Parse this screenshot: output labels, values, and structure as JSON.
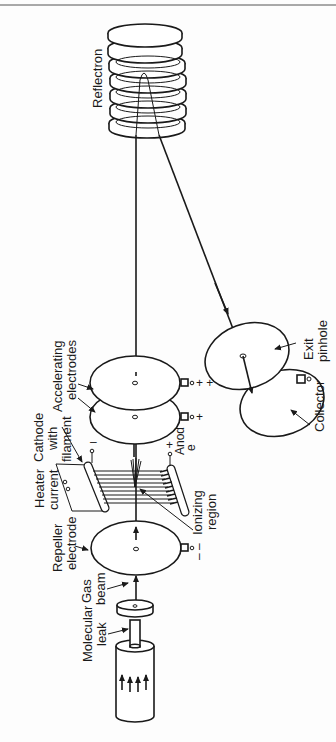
{
  "diagram": {
    "orientation": "rotated 90 degrees counter-clockwise",
    "labels": {
      "reflectron": "Reflectron",
      "accelerating_line1": "Accelerating",
      "accelerating_line2": "electrodes",
      "exit_line1": "Exit",
      "exit_line2": "pinhole",
      "collector": "Collector",
      "cathode_line1": "Cathode",
      "cathode_line2": "with",
      "cathode_line3": "filament",
      "heater_line1": "Heater",
      "heater_line2": "current",
      "anode_line1": "Anod",
      "anode_line2": "e",
      "ionizing_line1": "Ionizing",
      "ionizing_line2": "region",
      "repeller_line1": "Repeller",
      "repeller_line2": "electrode",
      "gas_line1": "Gas",
      "gas_line2": "beam",
      "leak_line1": "Molecular",
      "leak_line2": "leak"
    },
    "signs": {
      "acc1": "+ +",
      "acc2": "+",
      "anode": "+",
      "cathode": "–",
      "repeller": "– –"
    },
    "colors": {
      "ink": "#1a1a1a",
      "background": "#fdfdfd"
    }
  }
}
